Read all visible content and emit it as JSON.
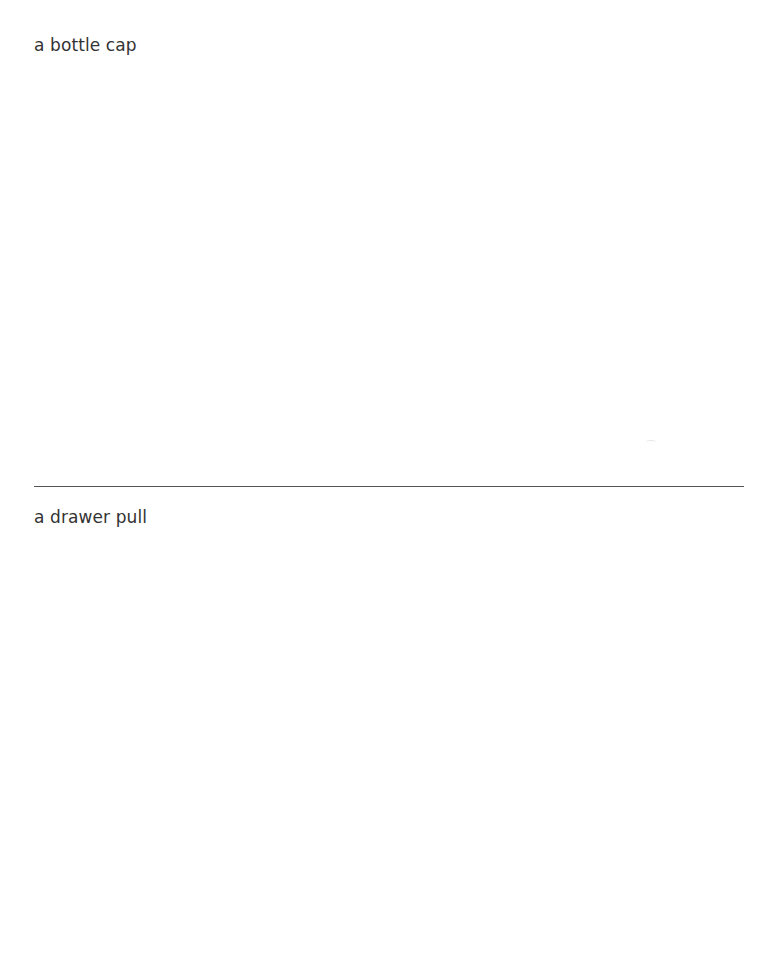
{
  "sections": [
    {
      "label": "a bottle cap"
    },
    {
      "label": "a drawer pull"
    }
  ],
  "colors": {
    "background": "#ffffff",
    "text": "#333333",
    "divider": "#555555"
  }
}
